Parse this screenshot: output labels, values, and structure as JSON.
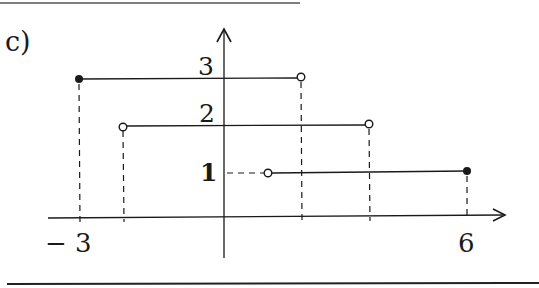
{
  "figure": {
    "part_label": "c)",
    "colors": {
      "ink": "#1a1a1a",
      "rule": "#333333",
      "background": "#ffffff"
    },
    "axes": {
      "x_ticks": [
        {
          "label": "− 3",
          "value": -3
        },
        {
          "label": "6",
          "value": 6
        }
      ],
      "y_ticks": [
        {
          "label": "3",
          "value": 3
        },
        {
          "label": "2",
          "value": 2
        },
        {
          "label": "1",
          "value": 1
        }
      ]
    },
    "segments": [
      {
        "level": 3,
        "left_endpoint": "closed",
        "right_endpoint": "open",
        "x_start_label": "-3",
        "x_end_label": ""
      },
      {
        "level": 2,
        "left_endpoint": "open",
        "right_endpoint": "open",
        "x_start_label": "",
        "x_end_label": ""
      },
      {
        "level": 1,
        "left_endpoint": "open",
        "right_endpoint": "closed",
        "x_start_label": "",
        "x_end_label": "6"
      }
    ]
  }
}
